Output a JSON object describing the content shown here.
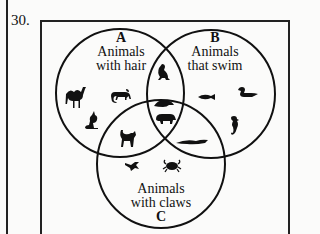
{
  "question": {
    "number": "30."
  },
  "venn": {
    "sets": [
      {
        "letter": "A",
        "line1": "Animals",
        "line2": "with hair"
      },
      {
        "letter": "B",
        "line1": "Animals",
        "line2": "that swim"
      },
      {
        "letter": "C",
        "line1": "Animals",
        "line2": "with claws"
      }
    ],
    "regions": {
      "A_only": [
        "camel",
        "monkey",
        "kangaroo"
      ],
      "B_only": [
        "fish",
        "duck",
        "seahorse"
      ],
      "C_only": [
        "starfish",
        "crab"
      ],
      "A_and_B": [
        "seal"
      ],
      "A_and_C": [
        "cat"
      ],
      "B_and_C": [
        "alligator"
      ],
      "A_and_B_and_C": [
        "beaver",
        "bear"
      ]
    }
  }
}
